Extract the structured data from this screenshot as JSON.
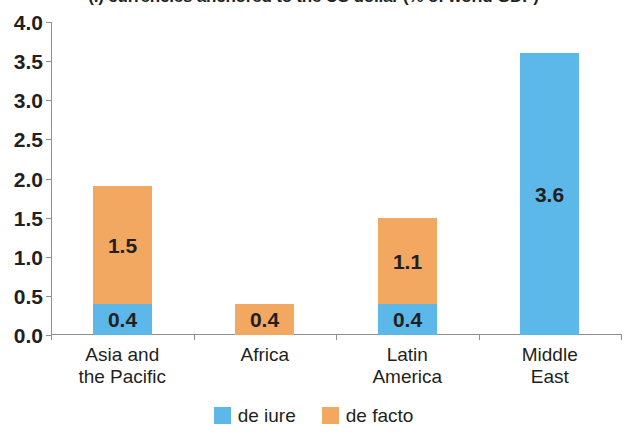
{
  "chart_data": {
    "type": "bar",
    "subtype": "stacked",
    "title": "(.) currencies anchored to the US dollar (% of world GDP)",
    "xlabel": "",
    "ylabel": "",
    "ylim": [
      0.0,
      4.0
    ],
    "yticks": [
      "0.0",
      "0.5",
      "1.0",
      "1.5",
      "2.0",
      "2.5",
      "3.0",
      "3.5",
      "4.0"
    ],
    "ytick_values": [
      0.0,
      0.5,
      1.0,
      1.5,
      2.0,
      2.5,
      3.0,
      3.5,
      4.0
    ],
    "grid": false,
    "legend_position": "bottom-center",
    "categories": [
      "Asia and\nthe Pacific",
      "Africa",
      "Latin\nAmerica",
      "Middle\nEast"
    ],
    "category_plain": [
      "Asia and the Pacific",
      "Africa",
      "Latin America",
      "Middle East"
    ],
    "series": [
      {
        "name": "de iure",
        "color": "#5BB8E8",
        "values": [
          0.4,
          0.0,
          0.4,
          3.6
        ],
        "labels": [
          "0.4",
          "",
          "0.4",
          "3.6"
        ]
      },
      {
        "name": "de facto",
        "color": "#F2A860",
        "values": [
          1.5,
          0.4,
          1.1,
          0.0
        ],
        "labels": [
          "1.5",
          "0.4",
          "1.1",
          ""
        ]
      }
    ],
    "totals": [
      1.9,
      0.4,
      1.5,
      3.6
    ]
  },
  "colors": {
    "de_iure": "#5BB8E8",
    "de_facto": "#F2A860",
    "axis": "#8e8e8e",
    "text": "#231f20",
    "background": "#ffffff"
  },
  "legend": [
    {
      "label": "de iure",
      "color": "#5BB8E8"
    },
    {
      "label": "de facto",
      "color": "#F2A860"
    }
  ]
}
